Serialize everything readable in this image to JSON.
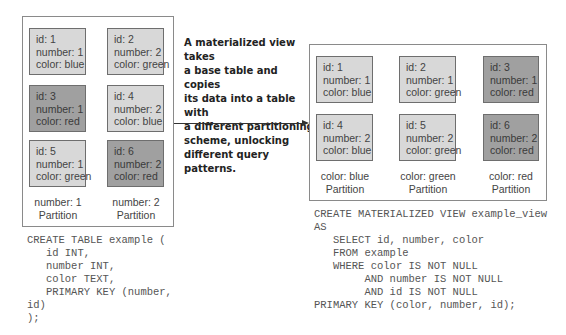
{
  "base_table": {
    "rows": [
      {
        "id": "id: 1",
        "number": "number: 1",
        "color": "color: blue",
        "shade": "light"
      },
      {
        "id": "id: 2",
        "number": "number: 2",
        "color": "color: green",
        "shade": "light"
      },
      {
        "id": "id: 3",
        "number": "number: 1",
        "color": "color: red",
        "shade": "dark"
      },
      {
        "id": "id: 4",
        "number": "number: 2",
        "color": "color: blue",
        "shade": "light"
      },
      {
        "id": "id: 5",
        "number": "number: 1",
        "color": "color: green",
        "shade": "light"
      },
      {
        "id": "id: 6",
        "number": "number: 2",
        "color": "color: red",
        "shade": "dark"
      }
    ],
    "partitions": [
      {
        "key": "number: 1",
        "label": "Partition"
      },
      {
        "key": "number: 2",
        "label": "Partition"
      }
    ],
    "code": "CREATE TABLE example (\n   id INT,\n   number INT,\n   color TEXT,\n   PRIMARY KEY (number,\nid)\n);"
  },
  "callout": {
    "text": "A materialized view takes a base table and copies its data into a table with a different partitioning scheme, unlocking different query patterns.",
    "lines": [
      "A materialized view takes",
      "a base table and copies",
      "its data into a table with",
      "a different partitioning",
      "scheme, unlocking",
      "different query patterns."
    ]
  },
  "materialized_view": {
    "rows": [
      {
        "id": "id: 1",
        "number": "number: 1",
        "color": "color: blue",
        "shade": "light"
      },
      {
        "id": "id: 2",
        "number": "number: 1",
        "color": "color: green",
        "shade": "light"
      },
      {
        "id": "id: 3",
        "number": "number: 1",
        "color": "color: red",
        "shade": "dark"
      },
      {
        "id": "id: 4",
        "number": "number: 2",
        "color": "color: blue",
        "shade": "light"
      },
      {
        "id": "id: 5",
        "number": "number: 2",
        "color": "color: green",
        "shade": "light"
      },
      {
        "id": "id: 6",
        "number": "number: 2",
        "color": "color: red",
        "shade": "dark"
      }
    ],
    "partitions": [
      {
        "key": "color: blue",
        "label": "Partition"
      },
      {
        "key": "color: green",
        "label": "Partition"
      },
      {
        "key": "color: red",
        "label": "Partition"
      }
    ],
    "code": "CREATE MATERIALIZED VIEW example_view\nAS\n   SELECT id, number, color\n   FROM example\n   WHERE color IS NOT NULL\n        AND number IS NOT NULL\n        AND id IS NOT NULL\nPRIMARY KEY (color, number, id);"
  },
  "colors": {
    "light_cell": "#d8d8d8",
    "dark_cell": "#a0a0a0",
    "border": "#6e6e6e",
    "frame": "#8a8a8a"
  }
}
